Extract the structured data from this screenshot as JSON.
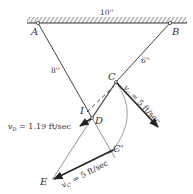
{
  "diagram": {
    "points": {
      "A": {
        "label": "A",
        "x": 38,
        "y": 23
      },
      "B": {
        "label": "B",
        "x": 170,
        "y": 23
      },
      "C": {
        "label": "C",
        "x": 116,
        "y": 82
      },
      "D": {
        "label": "D",
        "x": 92,
        "y": 118
      },
      "I": {
        "label": "I",
        "x": 87,
        "y": 112
      },
      "C_prime": {
        "label": "C'",
        "x": 113,
        "y": 150
      },
      "E": {
        "label": "E",
        "x": 52,
        "y": 180
      }
    },
    "dimensions": {
      "AB": "10''",
      "AD": "8''",
      "BC": "6''"
    },
    "velocities": {
      "vC": {
        "label": "v",
        "sub": "C",
        "text": " = 5 ft/sec"
      },
      "vD": {
        "label": "v",
        "sub": "D",
        "text": " = 1.19 ft/sec"
      },
      "vC_prime": {
        "label": "v",
        "sub": "C'",
        "text": " = 5 ft/sec"
      }
    },
    "colors": {
      "line": "#444444",
      "thick": "#222222",
      "thin": "#888888"
    }
  }
}
